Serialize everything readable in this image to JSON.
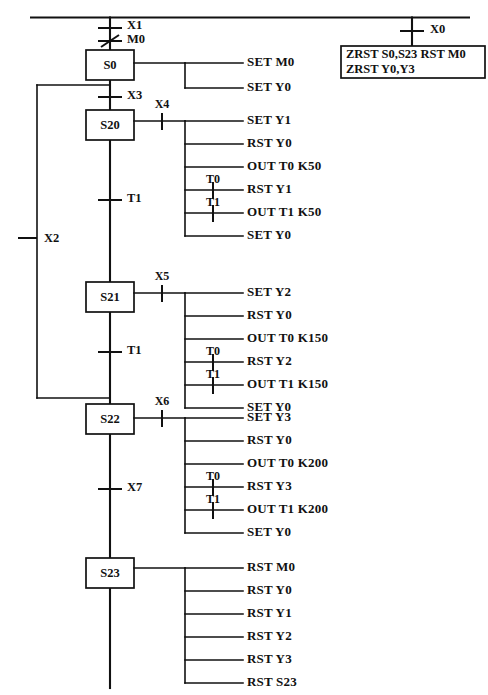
{
  "diagram": {
    "type": "sfc-ladder",
    "title_fragment": "",
    "power_rail": {
      "label": ""
    },
    "left_branch": {
      "contact": "X2",
      "contact_type": "no"
    },
    "states": [
      {
        "id": "S0",
        "label": "S0",
        "entry_transitions": [
          {
            "label": "X1",
            "type": "no"
          },
          {
            "label": "M0",
            "type": "nc"
          }
        ],
        "branch_contact": null,
        "outputs": [
          {
            "text": "SET  M0",
            "contact": null
          },
          {
            "text": "SET  Y0",
            "contact": null
          }
        ],
        "exit_transition": {
          "label": "X3",
          "type": "no"
        }
      },
      {
        "id": "S20",
        "label": "S20",
        "entry_transitions": [],
        "branch_contact": {
          "label": "X4",
          "type": "no"
        },
        "outputs": [
          {
            "text": "SET  Y1",
            "contact": null
          },
          {
            "text": "RST  Y0",
            "contact": null
          },
          {
            "text": "OUT  T0  K50",
            "contact": null
          },
          {
            "text": "RST  Y1",
            "contact": {
              "label": "T0",
              "type": "no"
            }
          },
          {
            "text": "OUT  T1  K50",
            "contact": null
          },
          {
            "text": "SET  Y0",
            "contact": {
              "label": "T1",
              "type": "no"
            }
          }
        ],
        "exit_transition": {
          "label": "T1",
          "type": "no"
        }
      },
      {
        "id": "S21",
        "label": "S21",
        "entry_transitions": [],
        "branch_contact": {
          "label": "X5",
          "type": "no"
        },
        "outputs": [
          {
            "text": "SET  Y2",
            "contact": null
          },
          {
            "text": "RST  Y0",
            "contact": null
          },
          {
            "text": "OUT  T0  K150",
            "contact": null
          },
          {
            "text": "RST  Y2",
            "contact": {
              "label": "T0",
              "type": "no"
            }
          },
          {
            "text": "OUT  T1  K150",
            "contact": null
          },
          {
            "text": "SET  Y0",
            "contact": {
              "label": "T1",
              "type": "no"
            }
          }
        ],
        "exit_transition": {
          "label": "T1",
          "type": "no"
        }
      },
      {
        "id": "S22",
        "label": "S22",
        "entry_transitions": [],
        "branch_contact": {
          "label": "X6",
          "type": "no"
        },
        "outputs": [
          {
            "text": "SET  Y3",
            "contact": null
          },
          {
            "text": "RST  Y0",
            "contact": null
          },
          {
            "text": "OUT  T0  K200",
            "contact": null
          },
          {
            "text": "RST  Y3",
            "contact": {
              "label": "T0",
              "type": "no"
            }
          },
          {
            "text": "OUT  T1  K200",
            "contact": null
          },
          {
            "text": "SET  Y0",
            "contact": {
              "label": "T1",
              "type": "no"
            }
          }
        ],
        "exit_transition": {
          "label": "X7",
          "type": "no"
        }
      },
      {
        "id": "S23",
        "label": "S23",
        "entry_transitions": [],
        "branch_contact": null,
        "outputs": [
          {
            "text": "RST  M0",
            "contact": null
          },
          {
            "text": "RST  Y0",
            "contact": null
          },
          {
            "text": "RST  Y1",
            "contact": null
          },
          {
            "text": "RST  Y2",
            "contact": null
          },
          {
            "text": "RST  Y3",
            "contact": null
          },
          {
            "text": "RST  S23",
            "contact": null
          }
        ],
        "exit_transition": null
      }
    ],
    "reset_rung": {
      "contact": {
        "label": "X0",
        "type": "no"
      },
      "instruction_lines": [
        "ZRST  S0,S23   RST M0",
        "ZRST  Y0,Y3"
      ]
    }
  }
}
